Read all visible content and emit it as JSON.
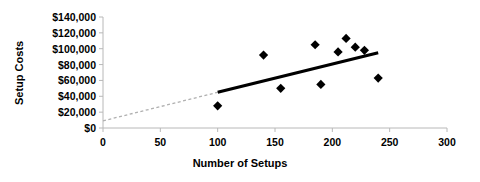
{
  "chart_data": {
    "type": "scatter",
    "title": "",
    "xlabel": "Number of Setups",
    "ylabel": "Setup Costs",
    "xlim": [
      0,
      300
    ],
    "ylim": [
      0,
      140000
    ],
    "xticks": [
      0,
      50,
      100,
      150,
      200,
      250,
      300
    ],
    "yticks": [
      0,
      20000,
      40000,
      60000,
      80000,
      100000,
      120000,
      140000
    ],
    "xtick_labels": [
      "0",
      "50",
      "100",
      "150",
      "200",
      "250",
      "300"
    ],
    "ytick_labels": [
      "$0",
      "$20,000",
      "$40,000",
      "$60,000",
      "$80,000",
      "$100,000",
      "$120,000",
      "$140,000"
    ],
    "grid": false,
    "legend": null,
    "marker": "diamond",
    "marker_color": "#000000",
    "points": [
      {
        "x": 100,
        "y": 28000
      },
      {
        "x": 140,
        "y": 92000
      },
      {
        "x": 155,
        "y": 50000
      },
      {
        "x": 185,
        "y": 105000
      },
      {
        "x": 190,
        "y": 55000
      },
      {
        "x": 205,
        "y": 96000
      },
      {
        "x": 212,
        "y": 113000
      },
      {
        "x": 220,
        "y": 102000
      },
      {
        "x": 228,
        "y": 98000
      },
      {
        "x": 240,
        "y": 63000
      }
    ],
    "trendline": {
      "style": "solid",
      "color": "#000000",
      "x_start": 100,
      "y_start": 45000,
      "x_end": 240,
      "y_end": 95000
    },
    "trendline_extension": {
      "style": "dotted",
      "color": "#b0b0b0",
      "x_start": 0,
      "y_start": 9000,
      "x_end": 100,
      "y_end": 45000
    }
  }
}
